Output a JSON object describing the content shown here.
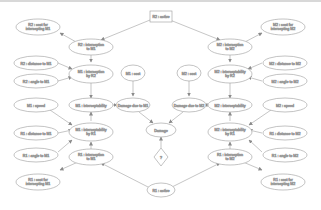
{
  "transcription_note": "Node labels are reconstructed from the low-resolution source and the left/right mirror structure (R1/R2, M1/M2 swapped). They are best-effort guesses, not verbatim transcriptions; exact wording and operators may differ.",
  "diagram": {
    "type": "influence-diagram",
    "nodes": {
      "r2_active": {
        "label": "R2 : active",
        "shape": "rect"
      },
      "r1_active": {
        "label": "R1 : active",
        "shape": "ellipse"
      },
      "decision": {
        "label": "?",
        "shape": "diamond"
      },
      "damage": {
        "label": "Damage",
        "shape": "ellipse"
      },
      "damage_m1": {
        "label": "Damage due to M1",
        "shape": "ellipse"
      },
      "damage_m2": {
        "label": "Damage due to M2",
        "shape": "ellipse"
      },
      "m1_cost": {
        "label": "M1 : cost",
        "shape": "ellipse"
      },
      "m2_cost": {
        "label": "M2 : cost",
        "shape": "ellipse"
      },
      "r2_cost_m1": {
        "label1": "R2 : cost for",
        "label2": "intercepting M1",
        "shape": "ellipse"
      },
      "r2_int_m1": {
        "label1": "R2 : interception",
        "label2": "to M1",
        "shape": "ellipse"
      },
      "r2_dist_m1": {
        "label": "R2 : distance to M1",
        "shape": "ellipse"
      },
      "r2_angle_m1": {
        "label": "R2 : angle to M1",
        "shape": "ellipse"
      },
      "m1_int_r2": {
        "label1": "M1 : interception",
        "label2": "by R2",
        "shape": "ellipse"
      },
      "m1_speed": {
        "label": "M1 : speed",
        "shape": "ellipse"
      },
      "m1_int": {
        "label": "M1 : interceptability",
        "shape": "ellipse"
      },
      "r1_dist_m1": {
        "label": "R1 : distance to M1",
        "shape": "ellipse"
      },
      "r1_angle_m1": {
        "label": "R1 : angle to M1",
        "shape": "ellipse"
      },
      "m1_int_r1": {
        "label1": "M1 : interceptability",
        "label2": "by R1",
        "shape": "ellipse"
      },
      "r1_int_m1": {
        "label1": "R1 : interception",
        "label2": "to M1",
        "shape": "ellipse"
      },
      "r1_cost_m1": {
        "label1": "R1 : cost for",
        "label2": "intercepting M1",
        "shape": "ellipse"
      },
      "m2_cost_r2": {
        "label1": "M2 : cost for",
        "label2": "intercepting M2",
        "shape": "ellipse"
      },
      "r2_int_m2": {
        "label1": "M2 : interception",
        "label2": "to M2",
        "shape": "ellipse"
      },
      "r2_dist_m2": {
        "label": "M2 : distance to M2",
        "shape": "ellipse"
      },
      "r2_angle_m2": {
        "label": "M2 : angle to M2",
        "shape": "ellipse"
      },
      "m2_int_r2": {
        "label1": "M2 : interceptability",
        "label2": "by R2",
        "shape": "ellipse"
      },
      "m2_speed": {
        "label": "M2 : speed",
        "shape": "ellipse"
      },
      "m2_int": {
        "label": "M2 : interceptability",
        "shape": "ellipse"
      },
      "r1_dist_m2": {
        "label": "R1 : distance to M2",
        "shape": "ellipse"
      },
      "r1_angle_m2": {
        "label": "R1 : angle to M2",
        "shape": "ellipse"
      },
      "m2_int_r1": {
        "label1": "M2 : interceptability",
        "label2": "by R1",
        "shape": "ellipse"
      },
      "r1_int_m2": {
        "label1": "R1 : interception",
        "label2": "to M2",
        "shape": "ellipse"
      },
      "r1_cost_m2": {
        "label1": "R1 : cost for",
        "label2": "intercepting M2",
        "shape": "ellipse"
      }
    },
    "colors": {
      "stroke": "#9a9a9a",
      "text": "#555555",
      "background": "#ffffff"
    }
  }
}
